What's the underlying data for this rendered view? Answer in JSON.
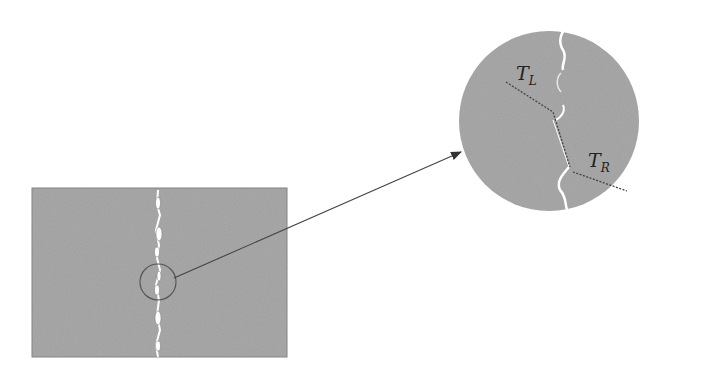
{
  "diagram": {
    "labels": {
      "left_tension": {
        "main": "T",
        "sub": "L"
      },
      "right_tension": {
        "main": "T",
        "sub": "R"
      }
    },
    "colors": {
      "material": "#a9a9a9",
      "crack": "#ffffff",
      "outline": "#555555",
      "arrow": "#444444"
    }
  }
}
